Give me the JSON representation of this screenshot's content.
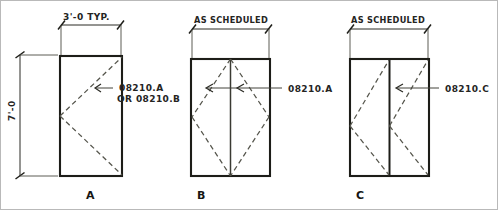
{
  "drawing": {
    "title": "door-type-elevations",
    "background_color": "#ffffff",
    "ink_color": "#1d1d18",
    "dashed_ink_color": "#55554c"
  },
  "panels": [
    {
      "id": "A",
      "letter": "A",
      "width_dimension": "3'-0 TYP.",
      "height_dimension": "7'-0",
      "annotation_line1": "08210.A",
      "annotation_line2": "OR 08210.B",
      "leaf_count": 1,
      "swing_type": "single-v-swing"
    },
    {
      "id": "B",
      "letter": "B",
      "width_dimension": "AS SCHEDULED",
      "height_dimension": "",
      "annotation_line1": "08210.A",
      "annotation_line2": "",
      "leaf_count": 2,
      "swing_type": "diamond-double-swing"
    },
    {
      "id": "C",
      "letter": "C",
      "width_dimension": "AS SCHEDULED",
      "height_dimension": "",
      "annotation_line1": "08210.C",
      "annotation_line2": "",
      "leaf_count": 2,
      "swing_type": "paired-v-swing"
    }
  ]
}
